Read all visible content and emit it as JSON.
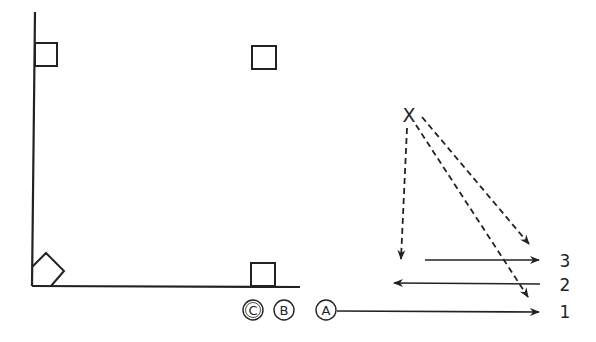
{
  "diagram": {
    "stroke_color": "#222222",
    "background": "#ffffff",
    "player_marker": "X",
    "circled_labels": [
      {
        "id": "C",
        "text": "C"
      },
      {
        "id": "B",
        "text": "B"
      },
      {
        "id": "A",
        "text": "A"
      }
    ],
    "lane_labels": [
      {
        "id": "lane-3",
        "text": "3"
      },
      {
        "id": "lane-2",
        "text": "2"
      },
      {
        "id": "lane-1",
        "text": "1"
      }
    ],
    "shapes": {
      "squares": 4,
      "description": "Field boundary with corner markers (squares), circled positions C, B, A, an X origin with dashed arrows, and numbered lanes 1–3 with solid arrows"
    }
  }
}
